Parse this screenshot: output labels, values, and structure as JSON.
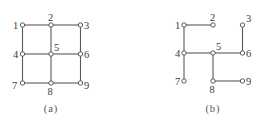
{
  "figures": [
    {
      "id": "a",
      "caption": "(a)",
      "caption_pos": [
        51,
        112
      ],
      "description": "3x3 grid graph with all horizontal and vertical edges",
      "nodes": [
        {
          "id": "1",
          "label": "1",
          "x": 22.5,
          "y": 25,
          "lx": 13,
          "ly": 29
        },
        {
          "id": "2",
          "label": "2",
          "x": 51,
          "y": 25,
          "lx": 48,
          "ly": 21
        },
        {
          "id": "3",
          "label": "3",
          "x": 80.5,
          "y": 25,
          "lx": 84,
          "ly": 29
        },
        {
          "id": "4",
          "label": "4",
          "x": 22.5,
          "y": 54,
          "lx": 13,
          "ly": 58
        },
        {
          "id": "5",
          "label": "5",
          "x": 51,
          "y": 54,
          "lx": 54,
          "ly": 51
        },
        {
          "id": "6",
          "label": "6",
          "x": 80.5,
          "y": 54,
          "lx": 84,
          "ly": 58
        },
        {
          "id": "7",
          "label": "7",
          "x": 22.5,
          "y": 83,
          "lx": 12,
          "ly": 89
        },
        {
          "id": "8",
          "label": "8",
          "x": 51,
          "y": 83,
          "lx": 47.5,
          "ly": 95
        },
        {
          "id": "9",
          "label": "9",
          "x": 80.5,
          "y": 83,
          "lx": 84,
          "ly": 89
        }
      ],
      "edges": [
        [
          "1",
          "2"
        ],
        [
          "2",
          "3"
        ],
        [
          "4",
          "5"
        ],
        [
          "5",
          "6"
        ],
        [
          "7",
          "8"
        ],
        [
          "8",
          "9"
        ],
        [
          "1",
          "4"
        ],
        [
          "4",
          "7"
        ],
        [
          "2",
          "5"
        ],
        [
          "5",
          "8"
        ],
        [
          "3",
          "6"
        ],
        [
          "6",
          "9"
        ]
      ]
    },
    {
      "id": "b",
      "caption": "(b)",
      "caption_pos": [
        213,
        112
      ],
      "description": "Spanning tree of the 3x3 grid graph",
      "nodes": [
        {
          "id": "1",
          "label": "1",
          "x": 184,
          "y": 25,
          "lx": 175,
          "ly": 29
        },
        {
          "id": "2",
          "label": "2",
          "x": 213,
          "y": 25,
          "lx": 210,
          "ly": 21
        },
        {
          "id": "3",
          "label": "3",
          "x": 242.5,
          "y": 25,
          "lx": 246,
          "ly": 22
        },
        {
          "id": "4",
          "label": "4",
          "x": 184,
          "y": 53,
          "lx": 175,
          "ly": 57
        },
        {
          "id": "5",
          "label": "5",
          "x": 213,
          "y": 53,
          "lx": 216,
          "ly": 50
        },
        {
          "id": "6",
          "label": "6",
          "x": 242.5,
          "y": 53,
          "lx": 246,
          "ly": 57
        },
        {
          "id": "7",
          "label": "7",
          "x": 184,
          "y": 81,
          "lx": 175,
          "ly": 85
        },
        {
          "id": "8",
          "label": "8",
          "x": 213,
          "y": 81,
          "lx": 209.5,
          "ly": 93
        },
        {
          "id": "9",
          "label": "9",
          "x": 242.5,
          "y": 81,
          "lx": 246,
          "ly": 85
        }
      ],
      "edges": [
        [
          "1",
          "2"
        ],
        [
          "1",
          "4"
        ],
        [
          "4",
          "7"
        ],
        [
          "4",
          "5"
        ],
        [
          "5",
          "6"
        ],
        [
          "3",
          "6"
        ],
        [
          "5",
          "8"
        ],
        [
          "8",
          "9"
        ]
      ]
    }
  ],
  "colors": {
    "edge": "#5a5a5a",
    "node_stroke": "#4a4a4a",
    "node_fill": "#ffffff",
    "label": "#3a3a3a",
    "caption": "#555555",
    "background": "#ffffff"
  },
  "node_radius": 2.2
}
